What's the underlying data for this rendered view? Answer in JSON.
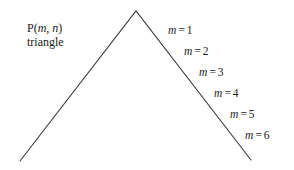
{
  "figure": {
    "width": 294,
    "height": 170,
    "background_color": "#ffffff",
    "stroke_color": "#3a3a3a",
    "text_color": "#1a1a1a"
  },
  "corner_label": {
    "line1_prefix": "P(",
    "line1_var1": "m",
    "line1_sep": ", ",
    "line1_var2": "n",
    "line1_suffix": ")",
    "line1_full": "P(m, n)",
    "line2": "triangle"
  },
  "triangle": {
    "apex": {
      "x": 136,
      "y": 11
    },
    "left_end": {
      "x": 20,
      "y": 161
    },
    "right_end": {
      "x": 251,
      "y": 160
    },
    "stroke_width": 1.1
  },
  "m_labels": [
    {
      "var": "m",
      "eq": "=",
      "value": "1",
      "text": "m = 1",
      "x": 168,
      "y": 24
    },
    {
      "var": "m",
      "eq": "=",
      "value": "2",
      "text": "m = 2",
      "x": 184,
      "y": 45
    },
    {
      "var": "m",
      "eq": "=",
      "value": "3",
      "text": "m = 3",
      "x": 199,
      "y": 66
    },
    {
      "var": "m",
      "eq": "=",
      "value": "4",
      "text": "m = 4",
      "x": 214,
      "y": 87
    },
    {
      "var": "m",
      "eq": "=",
      "value": "5",
      "text": "m = 5",
      "x": 230,
      "y": 108
    },
    {
      "var": "m",
      "eq": "=",
      "value": "6",
      "text": "m = 6",
      "x": 245,
      "y": 129
    }
  ]
}
